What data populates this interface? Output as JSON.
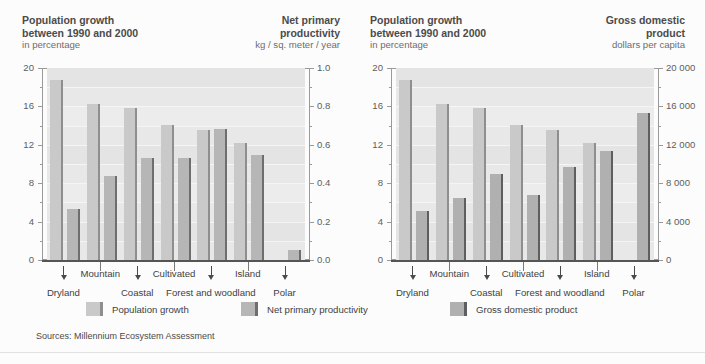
{
  "headers": {
    "pop_left": {
      "title_line1": "Population growth",
      "title_line2": "between 1990 and 2000",
      "unit": "in percentage"
    },
    "npp": {
      "title_line1": "Net primary",
      "title_line2": "productivity",
      "unit": "kg / sq. meter / year"
    },
    "pop_right": {
      "title_line1": "Population growth",
      "title_line2": "between 1990 and 2000",
      "unit": "in percentage"
    },
    "gdp": {
      "title_line1": "Gross domestic",
      "title_line2": "product",
      "unit": "dollars per capita"
    }
  },
  "legend": {
    "items": [
      {
        "label": "Population growth",
        "swatch": "light",
        "color": "#c9c9c9"
      },
      {
        "label": "Net primary productivity",
        "swatch": "mid",
        "color": "#b6b6b6"
      },
      {
        "label": "Gross domestic product",
        "swatch": "dark",
        "color": "#b0b0b0"
      }
    ]
  },
  "sources": "Sources: Millennium Ecosystem Assessment",
  "axis_labels": {
    "left_pct": [
      "20",
      "16",
      "12",
      "8",
      "4",
      "0"
    ],
    "npp": [
      "1.0",
      "0.8",
      "0.6",
      "0.4",
      "0.2",
      "0.0"
    ],
    "right_pct": [
      "20",
      "16",
      "12",
      "8",
      "4",
      "0"
    ],
    "gdp": [
      "20 000",
      "16 000",
      "12 000",
      "8 000",
      "4 000",
      "0"
    ]
  },
  "categories": [
    "Dryland",
    "Mountain",
    "Coastal",
    "Cultivated",
    "Forest and woodland",
    "Island",
    "Polar"
  ],
  "chart_data": [
    {
      "type": "bar",
      "title": "Population growth between 1990 and 2000 vs Net primary productivity",
      "categories": [
        "Dryland",
        "Mountain",
        "Coastal",
        "Cultivated",
        "Forest and woodland",
        "Island",
        "Polar"
      ],
      "series": [
        {
          "name": "Population growth",
          "unit": "in percentage",
          "axis": "left",
          "color": "#c9c9c9",
          "values": [
            18.7,
            16.3,
            15.8,
            14.1,
            13.5,
            12.2,
            0.0
          ]
        },
        {
          "name": "Net primary productivity",
          "unit": "kg / sq. meter / year",
          "axis": "right",
          "color": "#b6b6b6",
          "values": [
            0.265,
            0.435,
            0.53,
            0.53,
            0.68,
            0.545,
            0.05
          ]
        }
      ],
      "xlabel": "",
      "ylabel": "in percentage",
      "ylim": [
        0,
        20
      ],
      "y2label": "kg / sq. meter / year",
      "y2lim": [
        0,
        1.0
      ],
      "yticks": [
        0,
        4,
        8,
        12,
        16,
        20
      ],
      "y2ticks": [
        0.0,
        0.2,
        0.4,
        0.6,
        0.8,
        1.0
      ],
      "grid": true,
      "legend_position": "bottom"
    },
    {
      "type": "bar",
      "title": "Population growth between 1990 and 2000 vs Gross domestic product",
      "categories": [
        "Dryland",
        "Mountain",
        "Coastal",
        "Cultivated",
        "Forest and woodland",
        "Island",
        "Polar"
      ],
      "series": [
        {
          "name": "Population growth",
          "unit": "in percentage",
          "axis": "left",
          "color": "#c9c9c9",
          "values": [
            18.7,
            16.3,
            15.8,
            14.1,
            13.5,
            12.2,
            0.0
          ]
        },
        {
          "name": "Gross domestic product",
          "unit": "dollars per capita",
          "axis": "right",
          "color": "#b0b0b0",
          "values": [
            5100,
            6500,
            9000,
            6800,
            9700,
            11400,
            15300
          ]
        }
      ],
      "xlabel": "",
      "ylabel": "in percentage",
      "ylim": [
        0,
        20
      ],
      "y2label": "dollars per capita",
      "y2lim": [
        0,
        20000
      ],
      "yticks": [
        0,
        4,
        8,
        12,
        16,
        20
      ],
      "y2ticks": [
        0,
        4000,
        8000,
        12000,
        16000,
        20000
      ],
      "grid": true,
      "legend_position": "bottom"
    }
  ]
}
